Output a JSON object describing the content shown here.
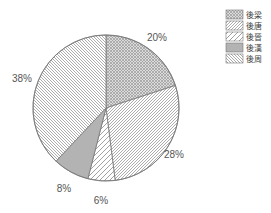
{
  "chart_data": {
    "type": "pie",
    "title": "",
    "categories": [
      "後梁",
      "後唐",
      "後晉",
      "後漢",
      "後周"
    ],
    "values": [
      20,
      28,
      6,
      8,
      38
    ],
    "unit": "%",
    "start_angle_deg": 0,
    "direction": "clockwise",
    "labels": [
      "20%",
      "28%",
      "6%",
      "8%",
      "38%"
    ],
    "patterns": [
      "crosshatch",
      "diagonal-forward",
      "diagonal-forward-wide",
      "crosshatch-dense",
      "diagonal-back"
    ],
    "legend_position": "top-right",
    "legend": [
      {
        "label": "後梁",
        "pattern": "crosshatch"
      },
      {
        "label": "後唐",
        "pattern": "diagonal-forward"
      },
      {
        "label": "後晉",
        "pattern": "diagonal-forward-wide"
      },
      {
        "label": "後漢",
        "pattern": "crosshatch-dense"
      },
      {
        "label": "後周",
        "pattern": "diagonal-back"
      }
    ]
  },
  "colors": {
    "stroke": "#777777",
    "hatch": "#8a8a8a",
    "text": "#555555"
  }
}
